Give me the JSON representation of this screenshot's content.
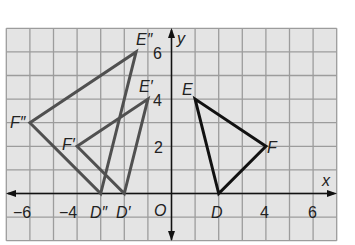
{
  "diagram": {
    "type": "coordinate-plane",
    "x_range": [
      -7,
      7
    ],
    "y_range": [
      -2,
      7
    ],
    "axis_labels": {
      "x": "x",
      "y": "y",
      "origin": "O"
    },
    "x_tick_labels": [
      {
        "value": -6,
        "text": "−6"
      },
      {
        "value": -4,
        "text": "−4"
      },
      {
        "value": 4,
        "text": "4"
      },
      {
        "value": 6,
        "text": "6"
      }
    ],
    "y_tick_labels": [
      {
        "value": 2,
        "text": "2"
      },
      {
        "value": 4,
        "text": "4"
      },
      {
        "value": 6,
        "text": "6"
      }
    ],
    "colors": {
      "background": "#e4e4e4",
      "grid": "#9c9c9c",
      "original": "#111111",
      "image": "#505050"
    },
    "triangles": [
      {
        "name": "DEF",
        "color": "#111111",
        "vertices": [
          {
            "label": "D",
            "x": 2,
            "y": 0
          },
          {
            "label": "E",
            "x": 1,
            "y": 4
          },
          {
            "label": "F",
            "x": 4,
            "y": 2
          }
        ]
      },
      {
        "name": "D'E'F'",
        "color": "#505050",
        "vertices": [
          {
            "label": "D′",
            "x": -2,
            "y": 0
          },
          {
            "label": "E′",
            "x": -1,
            "y": 4
          },
          {
            "label": "F′",
            "x": -4,
            "y": 2
          }
        ]
      },
      {
        "name": "D''E''F''",
        "color": "#505050",
        "vertices": [
          {
            "label": "D″",
            "x": -3,
            "y": 0
          },
          {
            "label": "E″",
            "x": -1.5,
            "y": 6
          },
          {
            "label": "F″",
            "x": -6,
            "y": 3
          }
        ]
      }
    ]
  }
}
